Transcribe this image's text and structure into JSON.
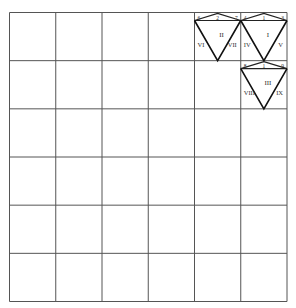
{
  "grid": {
    "rows": 6,
    "cols": 6,
    "x0": 9.5,
    "y0": 12.5,
    "x1": 287,
    "y1": 301.5,
    "line_color": "#555555"
  },
  "figures": [
    {
      "id": "triangle-II",
      "cell": {
        "row": 0,
        "col": 4
      },
      "numeral": "II",
      "top_labels": [
        "6",
        "2",
        "7"
      ],
      "side_labels": [
        "VI",
        "VII"
      ]
    },
    {
      "id": "triangle-I",
      "cell": {
        "row": 0,
        "col": 5
      },
      "numeral": "I",
      "top_labels": [
        "4",
        "1",
        "3"
      ],
      "side_labels": [
        "IV",
        "V"
      ]
    },
    {
      "id": "triangle-III",
      "cell": {
        "row": 1,
        "col": 5
      },
      "numeral": "III",
      "top_labels": [
        "8",
        "1",
        "9"
      ],
      "side_labels": [
        "VIII",
        "IX"
      ]
    }
  ]
}
